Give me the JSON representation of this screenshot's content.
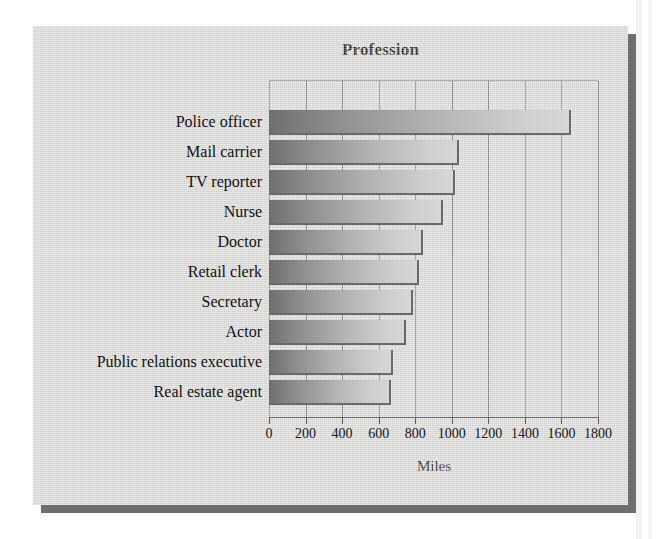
{
  "chart_data": {
    "type": "bar",
    "orientation": "horizontal",
    "title": "Profession",
    "xlabel": "Miles",
    "ylabel": "",
    "xlim": [
      0,
      1800
    ],
    "xticks": [
      0,
      200,
      400,
      600,
      800,
      1000,
      1200,
      1400,
      1600,
      1800
    ],
    "xtick_labels": [
      "0",
      "200",
      "400",
      "600",
      "800",
      "1000",
      "1200",
      "1400",
      "1600",
      "1800"
    ],
    "grid": "vertical",
    "legend": "none",
    "categories": [
      "Police officer",
      "Mail carrier",
      "TV reporter",
      "Nurse",
      "Doctor",
      "Retail clerk",
      "Secretary",
      "Actor",
      "Public relations executive",
      "Real estate agent"
    ],
    "values": [
      1650,
      1040,
      1020,
      950,
      840,
      820,
      790,
      750,
      680,
      670
    ],
    "units": "Miles",
    "bar_fill": "gray-gradient-left-dark-to-right-light",
    "colors": {
      "panel_background": "#d8d8d6",
      "panel_shadow": "#6e6e6e",
      "plot_border": "#7e7e7e",
      "axis": "#5b5b5b",
      "text": "#121212",
      "bar_dark": "#6f6f6f",
      "bar_light": "#d6d6d5",
      "bar_edge": "#6a6a6a",
      "page_background": "#ffffff"
    }
  }
}
